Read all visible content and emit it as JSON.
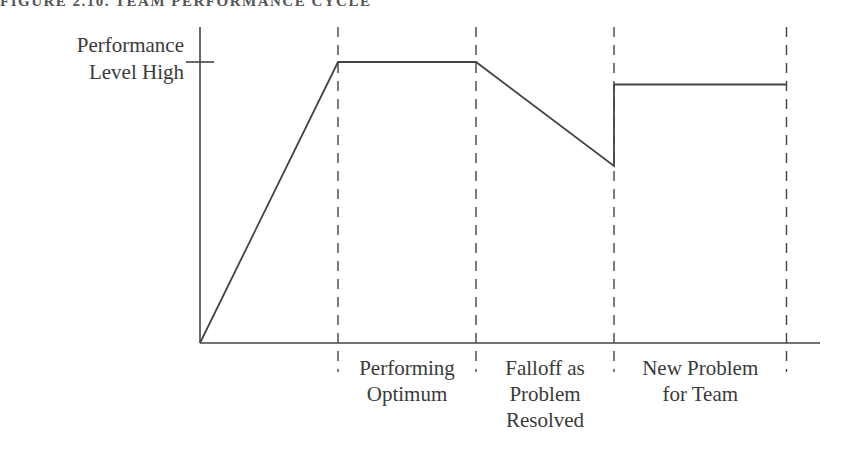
{
  "page_title": "FIGURE 2.10. TEAM PERFORMANCE CYCLE",
  "chart_data": {
    "type": "line",
    "title": "FIGURE 2.10. TEAM PERFORMANCE CYCLE",
    "ylabel_lines": [
      "Performance",
      "Level High"
    ],
    "xlabel": "",
    "y_tick_label": "Performance Level High",
    "y_tick_value": 1.0,
    "ylim": [
      0,
      1
    ],
    "xlim": [
      0,
      4.5
    ],
    "grid": "vertical dashed phase boundaries",
    "phase_boundaries": [
      1,
      2,
      3,
      4.25
    ],
    "categories": [
      {
        "lines": [
          "Performing",
          "Optimum"
        ],
        "from": 1,
        "to": 2
      },
      {
        "lines": [
          "Falloff as",
          "Problem",
          "Resolved"
        ],
        "from": 2,
        "to": 3
      },
      {
        "lines": [
          "New Problem",
          "for Team"
        ],
        "from": 3,
        "to": 4.25
      }
    ],
    "series": [
      {
        "name": "Team performance",
        "points": [
          {
            "x": 0,
            "y": 0
          },
          {
            "x": 1,
            "y": 1.0
          },
          {
            "x": 2,
            "y": 1.0
          },
          {
            "x": 3,
            "y": 0.63
          },
          {
            "x": 3,
            "y": 0.92
          },
          {
            "x": 4.25,
            "y": 0.92
          }
        ]
      }
    ]
  }
}
